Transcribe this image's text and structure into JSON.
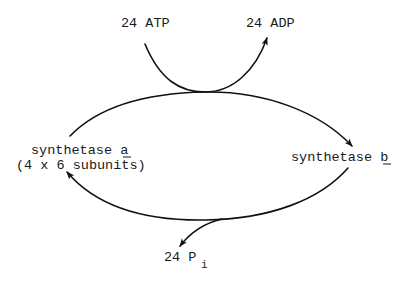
{
  "diagram": {
    "title": "",
    "colors": {
      "line": "#111111",
      "text": "#1a1a1a",
      "background": "#ffffff"
    },
    "labels": {
      "atp": "24 ATP",
      "adp": "24 ADP",
      "synthetase_a_prefix": "synthetase ",
      "synthetase_a_letter": "a",
      "synthetase_a_subunits": "(4 x 6 subunits)",
      "synthetase_b_prefix": "synthetase ",
      "synthetase_b_letter": "b",
      "pi_prefix": "24 P",
      "pi_subscript": "i"
    },
    "nodes": [
      {
        "id": "atp",
        "label": "24 ATP",
        "role": "input"
      },
      {
        "id": "adp",
        "label": "24 ADP",
        "role": "output"
      },
      {
        "id": "synthetase_a",
        "label": "synthetase a (4 x 6 subunits)",
        "role": "state"
      },
      {
        "id": "synthetase_b",
        "label": "synthetase b",
        "role": "state"
      },
      {
        "id": "pi",
        "label": "24 Pi",
        "role": "output"
      }
    ],
    "edges": [
      {
        "from": "atp",
        "to": "adp",
        "type": "coupled-arc"
      },
      {
        "from": "synthetase_a",
        "to": "synthetase_b",
        "type": "arrow",
        "coupled_with": "atp->adp"
      },
      {
        "from": "synthetase_b",
        "to": "synthetase_a",
        "type": "arrow",
        "releases": "pi"
      }
    ]
  }
}
